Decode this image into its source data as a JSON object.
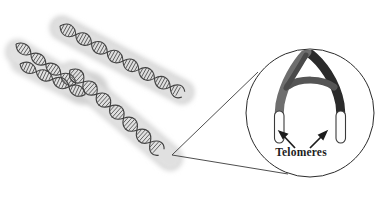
{
  "figure": {
    "background_color": "#ffffff",
    "width": 379,
    "height": 200
  },
  "chromosome": {
    "name": "chromosome-x-shape",
    "body_color": "#d4d4d4",
    "body_color_light": "#e2e2e2",
    "helix_color": "#4a4a4a",
    "helix_fill": "#9a9a9a",
    "arms": [
      {
        "id": "upper-left",
        "label": "upper left arm"
      },
      {
        "id": "upper-right",
        "label": "upper right arm"
      },
      {
        "id": "lower-left",
        "label": "lower left arm"
      },
      {
        "id": "lower-right",
        "label": "lower right arm"
      }
    ],
    "structure_label": "DNA double helix"
  },
  "callout": {
    "name": "magnifier-callout",
    "line_color": "#3a3a3a",
    "circle_stroke": "#2b2b2b",
    "circle_center_x": 310,
    "circle_center_y": 113,
    "circle_radius": 64,
    "origin_x": 172,
    "origin_y": 155
  },
  "inset": {
    "arch": {
      "left_arm_color": "#6e6e6e",
      "right_arm_color": "#2b2b2b",
      "crossbar_color": "#5a5a5a"
    },
    "telomere_caps": {
      "fill": "#fdfdfd",
      "stroke": "#3a3a3a",
      "count": 2
    },
    "arrows": {
      "color": "#1d1d1d",
      "count": 2,
      "left_direction": "up-left",
      "right_direction": "up-right"
    },
    "label": "Telomeres"
  }
}
